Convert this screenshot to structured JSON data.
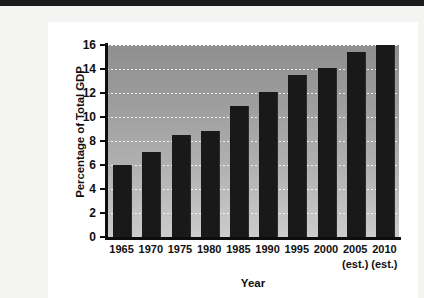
{
  "page": {
    "top_band_text": "",
    "background_color": "#f4f4f3",
    "card_color": "#ffffff"
  },
  "chart_data": {
    "type": "bar",
    "title": "",
    "xlabel": "Year",
    "ylabel": "Percentage of Total GDP",
    "categories": [
      "1965",
      "1970",
      "1975",
      "1980",
      "1985",
      "1990",
      "1995",
      "2000",
      "2005",
      "2010"
    ],
    "category_sublabels": [
      "",
      "",
      "",
      "",
      "",
      "",
      "",
      "",
      "(est.)",
      "(est.)"
    ],
    "values": [
      6.0,
      7.1,
      8.5,
      8.8,
      10.9,
      12.1,
      13.5,
      14.1,
      15.4,
      16.0
    ],
    "ylim": [
      0,
      16
    ],
    "ytick_values": [
      0,
      2,
      4,
      6,
      8,
      10,
      12,
      14,
      16
    ],
    "ytick_labels": [
      "0",
      "2",
      "4",
      "6",
      "8",
      "10",
      "12",
      "14",
      "16"
    ],
    "grid": true,
    "grid_style": "dotted-white-horizontal",
    "legend": null,
    "bar_color": "#191919",
    "plot_background": "gray-vertical-gradient",
    "plot_background_top_color": "#8f8f8f",
    "plot_background_bottom_color": "#cccccc"
  }
}
